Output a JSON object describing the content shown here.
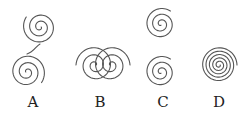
{
  "figure": {
    "stroke_color": "#555555",
    "background": "#ffffff",
    "panels": [
      {
        "label": "A",
        "label_pos": [
          33,
          95
        ],
        "description": "two spirals, upper-right and lower-left, connected by an S-curve",
        "spirals": [
          {
            "cx": 40,
            "cy": 27,
            "turns": 2.6,
            "r": 17,
            "dir": 1,
            "start": 0
          },
          {
            "cx": 27,
            "cy": 72,
            "turns": 2.6,
            "r": 18,
            "dir": 1,
            "start": 3.14159
          }
        ],
        "connector": "M27,54 C34,52 36,46 40,44"
      },
      {
        "label": "B",
        "label_pos": [
          100,
          95
        ],
        "description": "two overlapping horizontal spirals",
        "spirals": [
          {
            "cx": 95,
            "cy": 65,
            "turns": 2.5,
            "r": 19,
            "dir": -1,
            "start": 0
          },
          {
            "cx": 111,
            "cy": 65,
            "turns": 2.5,
            "r": 19,
            "dir": 1,
            "start": 3.14159
          }
        ]
      },
      {
        "label": "C",
        "label_pos": [
          163,
          95
        ],
        "description": "two vertically stacked spirals with same winding",
        "spirals": [
          {
            "cx": 161,
            "cy": 24,
            "turns": 2.6,
            "r": 16,
            "dir": 1,
            "start": 1.57
          },
          {
            "cx": 161,
            "cy": 72,
            "turns": 2.6,
            "r": 16,
            "dir": 1,
            "start": 1.57
          }
        ]
      },
      {
        "label": "D",
        "label_pos": [
          219,
          95
        ],
        "description": "single tightly wound spiral",
        "spirals": [
          {
            "cx": 219,
            "cy": 65,
            "turns": 5,
            "r": 18,
            "dir": 1,
            "start": 0
          }
        ]
      }
    ]
  }
}
